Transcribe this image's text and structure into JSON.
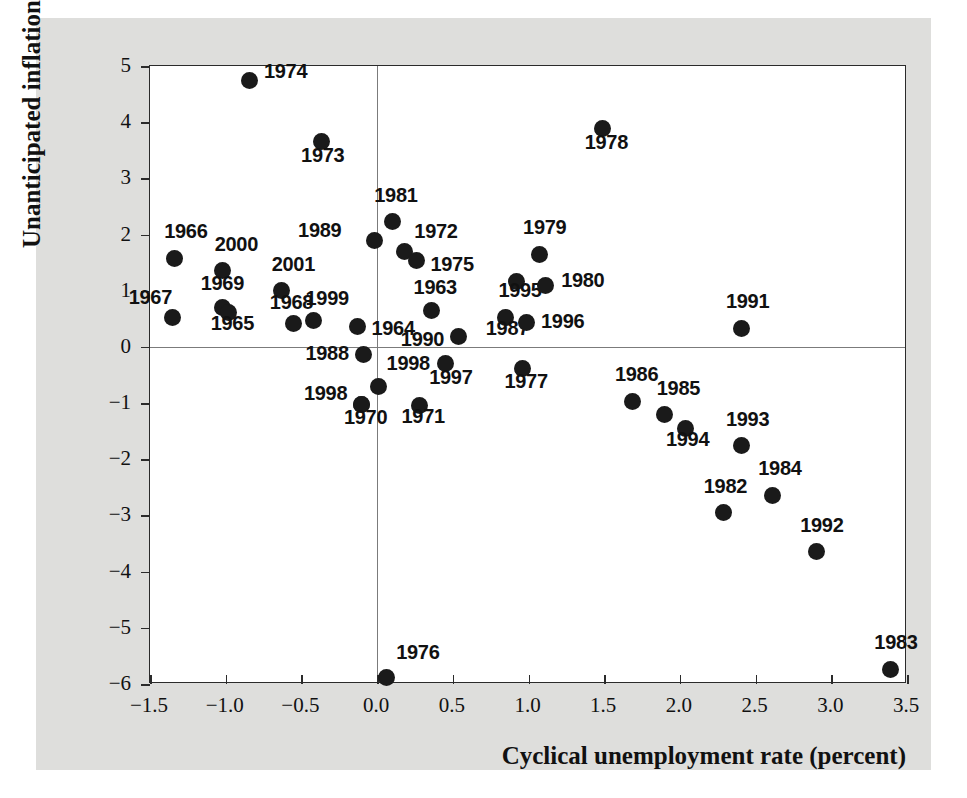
{
  "chart_data": {
    "type": "scatter",
    "title": "",
    "xlabel": "Cyclical unemployment rate (percent)",
    "ylabel": "Unanticipated inflation",
    "xlim": [
      -1.5,
      3.5
    ],
    "ylim": [
      -6,
      5
    ],
    "xticks": [
      -1.5,
      -1.0,
      -0.5,
      0.0,
      0.5,
      1.0,
      1.5,
      2.0,
      2.5,
      3.0,
      3.5
    ],
    "xtick_labels": [
      "−1.5",
      "−1.0",
      "−0.5",
      "0.0",
      "0.5",
      "1.0",
      "1.5",
      "2.0",
      "2.5",
      "3.0",
      "3.5"
    ],
    "yticks": [
      5,
      4,
      3,
      2,
      1,
      0,
      -1,
      -2,
      -3,
      -4,
      -5,
      -6
    ],
    "ytick_labels": [
      "5",
      "4",
      "3",
      "2",
      "1",
      "0",
      "−1",
      "−2",
      "−3",
      "−4",
      "−5",
      "−6"
    ],
    "grid": false,
    "legend": null,
    "zero_lines": {
      "horizontal_at_y": 0,
      "vertical_at_x": 0.0
    },
    "marker_color": "#1a1a1a",
    "points": [
      {
        "label": "1974",
        "x": -0.84,
        "y": 4.75,
        "label_dx": 14,
        "label_dy": -10
      },
      {
        "label": "1973",
        "x": -0.37,
        "y": 3.65,
        "label_dx": -20,
        "label_dy": 12
      },
      {
        "label": "1978",
        "x": 1.49,
        "y": 3.88,
        "label_dx": -18,
        "label_dy": 12
      },
      {
        "label": "1981",
        "x": 0.1,
        "y": 2.23,
        "label_dx": -18,
        "label_dy": -28
      },
      {
        "label": "1989",
        "x": -0.02,
        "y": 1.9,
        "label_dx": -76,
        "label_dy": -11
      },
      {
        "label": "1972",
        "x": 0.18,
        "y": 1.69,
        "label_dx": 10,
        "label_dy": -22
      },
      {
        "label": "1975",
        "x": 0.26,
        "y": 1.54,
        "label_dx": 14,
        "label_dy": 3
      },
      {
        "label": "1979",
        "x": 1.07,
        "y": 1.65,
        "label_dx": -16,
        "label_dy": -28
      },
      {
        "label": "1966",
        "x": -1.34,
        "y": 1.58,
        "label_dx": -10,
        "label_dy": -28
      },
      {
        "label": "2000",
        "x": -1.02,
        "y": 1.36,
        "label_dx": -8,
        "label_dy": -28
      },
      {
        "label": "2001",
        "x": -0.63,
        "y": 1.0,
        "label_dx": -10,
        "label_dy": -28
      },
      {
        "label": "1995",
        "x": 0.92,
        "y": 1.17,
        "label_dx": -18,
        "label_dy": 8
      },
      {
        "label": "1980",
        "x": 1.11,
        "y": 1.1,
        "label_dx": 16,
        "label_dy": -6
      },
      {
        "label": "1991",
        "x": 2.41,
        "y": 0.33,
        "label_dx": -16,
        "label_dy": -28
      },
      {
        "label": "1967",
        "x": -1.35,
        "y": 0.52,
        "label_dx": -44,
        "label_dy": -22
      },
      {
        "label": "1969",
        "x": -1.02,
        "y": 0.7,
        "label_dx": -22,
        "label_dy": -26
      },
      {
        "label": "1965",
        "x": -0.98,
        "y": 0.62,
        "label_dx": -18,
        "label_dy": 10
      },
      {
        "label": "1968",
        "x": -0.55,
        "y": 0.42,
        "label_dx": -24,
        "label_dy": -22
      },
      {
        "label": "1999",
        "x": -0.42,
        "y": 0.47,
        "label_dx": -8,
        "label_dy": -24
      },
      {
        "label": "1963",
        "x": 0.36,
        "y": 0.65,
        "label_dx": -18,
        "label_dy": -24
      },
      {
        "label": "1987",
        "x": 0.85,
        "y": 0.52,
        "label_dx": -20,
        "label_dy": 9
      },
      {
        "label": "1996",
        "x": 0.99,
        "y": 0.43,
        "label_dx": 14,
        "label_dy": -3
      },
      {
        "label": "1964",
        "x": -0.13,
        "y": 0.36,
        "label_dx": 14,
        "label_dy": 0
      },
      {
        "label": "1990",
        "x": 0.54,
        "y": 0.18,
        "label_dx": -58,
        "label_dy": 1
      },
      {
        "label": "1988",
        "x": -0.09,
        "y": -0.13,
        "label_dx": -58,
        "label_dy": -2
      },
      {
        "label": "1998",
        "x": 0.01,
        "y": -0.7,
        "label_dx": 8,
        "label_dy": -24
      },
      {
        "label": "1998",
        "x": -0.1,
        "y": -1.02,
        "label_dx": -58,
        "label_dy": -12
      },
      {
        "label": "1970",
        "x": -0.1,
        "y": -1.02,
        "label_dx": -18,
        "label_dy": 12
      },
      {
        "label": "1997",
        "x": 0.45,
        "y": -0.3,
        "label_dx": -16,
        "label_dy": 12
      },
      {
        "label": "1971",
        "x": 0.28,
        "y": -1.04,
        "label_dx": -18,
        "label_dy": 10
      },
      {
        "label": "1977",
        "x": 0.96,
        "y": -0.38,
        "label_dx": -18,
        "label_dy": 12
      },
      {
        "label": "1986",
        "x": 1.69,
        "y": -0.97,
        "label_dx": -18,
        "label_dy": -28
      },
      {
        "label": "1985",
        "x": 1.9,
        "y": -1.21,
        "label_dx": -8,
        "label_dy": -28
      },
      {
        "label": "1994",
        "x": 2.04,
        "y": -1.45,
        "label_dx": -20,
        "label_dy": 10
      },
      {
        "label": "1993",
        "x": 2.41,
        "y": -1.76,
        "label_dx": -16,
        "label_dy": -28
      },
      {
        "label": "1984",
        "x": 2.61,
        "y": -2.64,
        "label_dx": -14,
        "label_dy": -28
      },
      {
        "label": "1982",
        "x": 2.29,
        "y": -2.95,
        "label_dx": -20,
        "label_dy": -28
      },
      {
        "label": "1992",
        "x": 2.9,
        "y": -3.65,
        "label_dx": -16,
        "label_dy": -28
      },
      {
        "label": "1983",
        "x": 3.39,
        "y": -5.74,
        "label_dx": -16,
        "label_dy": -28
      },
      {
        "label": "1976",
        "x": 0.06,
        "y": -5.88,
        "label_dx": 10,
        "label_dy": -26
      }
    ]
  }
}
